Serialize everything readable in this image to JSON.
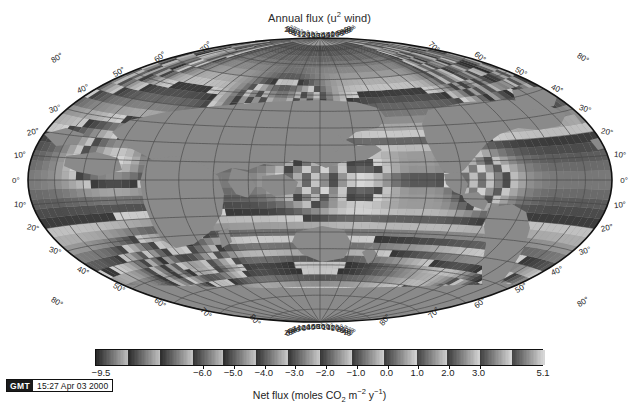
{
  "figure": {
    "title_main": "Annual flux (u",
    "title_sup": "2",
    "title_tail": " wind)",
    "title_full": "Annual flux (u2 wind)",
    "projection": "hammer",
    "central_longitude": 180,
    "background_color": "#ffffff",
    "land_color": "#8c8c8c",
    "frame_color": "#141414",
    "graticule_color": "#3a3a3a"
  },
  "axes": {
    "lon_labels_top": [
      "80°",
      "0°",
      "20°",
      "40°",
      "60°",
      "80°",
      "100°",
      "120°",
      "140°",
      "160°",
      "180°",
      "160°",
      "140°",
      "120°",
      "100°",
      "80°",
      "60°",
      "40°",
      "20°",
      "0°",
      "80°"
    ],
    "lon_labels_bottom": [
      "80°",
      "0°",
      "20°",
      "40°",
      "60°",
      "80°",
      "100°",
      "120°",
      "140°",
      "160°",
      "180°",
      "160°",
      "140°",
      "120°",
      "100°",
      "80°",
      "60°",
      "40°",
      "20°",
      "0°",
      "80°"
    ],
    "lon_values": [
      -100,
      0,
      20,
      40,
      60,
      80,
      100,
      120,
      140,
      160,
      180,
      200,
      220,
      240,
      260,
      280,
      300,
      320,
      340,
      360,
      460
    ],
    "lat_labels_left": [
      "70°",
      "60°",
      "50°",
      "40°",
      "30°",
      "20°",
      "10°",
      "0°",
      "10°",
      "20°",
      "30°",
      "40°",
      "50°",
      "60°",
      "70°",
      "80°"
    ],
    "lat_labels_right": [
      "70°",
      "60°",
      "50°",
      "40°",
      "30°",
      "20°",
      "10°",
      "0°",
      "10°",
      "20°",
      "30°",
      "40°",
      "50°",
      "60°",
      "70°",
      "80°"
    ],
    "lat_values": [
      70,
      60,
      50,
      40,
      30,
      20,
      10,
      0,
      -10,
      -20,
      -30,
      -40,
      -50,
      -60,
      -70,
      -80
    ],
    "lat_tick_step_deg": 10,
    "lon_tick_step_deg": 20
  },
  "colorbar": {
    "min": -9.5,
    "max": 5.1,
    "min_label": "−9.5",
    "max_label": "5.1",
    "tick_labels": [
      "−6.0",
      "−5.0",
      "−4.0",
      "−3.0",
      "−2.0",
      "−1.0",
      "0.0",
      "1.0",
      "2.0",
      "3.0"
    ],
    "tick_values": [
      -6.0,
      -5.0,
      -4.0,
      -3.0,
      -2.0,
      -1.0,
      0.0,
      1.0,
      2.0,
      3.0
    ],
    "caption_main": "Net flux (moles CO",
    "caption_sub": "2",
    "caption_mid": " m",
    "caption_sup1": "−2",
    "caption_mid2": " y",
    "caption_sup2": "−1",
    "caption_tail": ")",
    "caption_full": "Net flux (moles CO2 m-2 y-1)"
  },
  "stamp": {
    "badge": "GMT",
    "datetime": "15:27 Apr 03 2000"
  },
  "chart_data": {
    "type": "heatmap",
    "title": "Annual flux (u2 wind)",
    "xlabel": "",
    "ylabel": "",
    "zlabel": "Net flux (moles CO2 m-2 y-1)",
    "zlim": [
      -9.5,
      5.1
    ],
    "grid": true,
    "legend": "colorbar-below",
    "regions": [
      {
        "name": "equatorial-pacific-central",
        "lon": 200,
        "lat": 0,
        "value": 4.6
      },
      {
        "name": "equatorial-pacific-east",
        "lon": 250,
        "lat": 0,
        "value": 3.6
      },
      {
        "name": "north-atlantic-subpolar",
        "lon": 330,
        "lat": 55,
        "value": -5.2
      },
      {
        "name": "norwegian-sea",
        "lon": 0,
        "lat": 68,
        "value": -6.5
      },
      {
        "name": "north-pacific-kuroshio",
        "lon": 150,
        "lat": 40,
        "value": -4.4
      },
      {
        "name": "southern-ocean-belt",
        "lon": 180,
        "lat": -50,
        "value": -2.2
      },
      {
        "name": "arabian-sea",
        "lon": 60,
        "lat": 12,
        "value": 1.9
      },
      {
        "name": "southern-indian",
        "lon": 80,
        "lat": -45,
        "value": -2.6
      },
      {
        "name": "weddell-sea",
        "lon": 330,
        "lat": -62,
        "value": -3.4
      }
    ]
  }
}
